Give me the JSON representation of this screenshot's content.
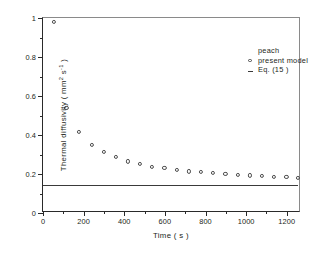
{
  "chart_data": {
    "type": "scatter",
    "title": "",
    "xlabel": "Time ( s )",
    "ylabel": "Thermal diffusivity ( mm",
    "ylabel_sup": "2",
    "ylabel_tail": " s",
    "ylabel_sup2": "-1",
    "ylabel_end": " )",
    "xlim": [
      0,
      1270
    ],
    "ylim": [
      0,
      1
    ],
    "grid": false,
    "legend_position": "top-right",
    "x_ticks_major": [
      0,
      200,
      400,
      600,
      800,
      1000,
      1200
    ],
    "x_ticks_minor": [
      100,
      300,
      500,
      700,
      900,
      1100
    ],
    "x_tick_labels": [
      "0",
      "200",
      "400",
      "600",
      "800",
      "1000",
      "1200"
    ],
    "y_ticks_major": [
      0,
      0.2,
      0.4,
      0.6,
      0.8,
      1
    ],
    "y_ticks_minor": [
      0.1,
      0.3,
      0.5,
      0.7,
      0.9
    ],
    "y_tick_labels": [
      "0",
      "0.2",
      "0.4",
      "0.6",
      "0.8",
      "1"
    ],
    "series": [
      {
        "name": "present model",
        "marker": "open-circle",
        "x": [
          55,
          115,
          178,
          240,
          300,
          358,
          418,
          478,
          538,
          598,
          658,
          718,
          778,
          838,
          898,
          958,
          1018,
          1078,
          1138,
          1198,
          1255
        ],
        "y": [
          0.978,
          0.538,
          0.414,
          0.35,
          0.312,
          0.289,
          0.265,
          0.251,
          0.238,
          0.231,
          0.221,
          0.213,
          0.209,
          0.204,
          0.2,
          0.195,
          0.193,
          0.191,
          0.187,
          0.185,
          0.179
        ]
      },
      {
        "name": "Eq. (15 )",
        "marker": "line",
        "type": "horizontal-line",
        "value": 0.145,
        "x_start": 0,
        "x_end": 1255
      }
    ]
  },
  "legend": {
    "sample_label": "peach",
    "entries": [
      {
        "marker": "open-circle",
        "label": "present model"
      },
      {
        "marker": "dash",
        "label": "Eq. (15 )"
      }
    ]
  }
}
